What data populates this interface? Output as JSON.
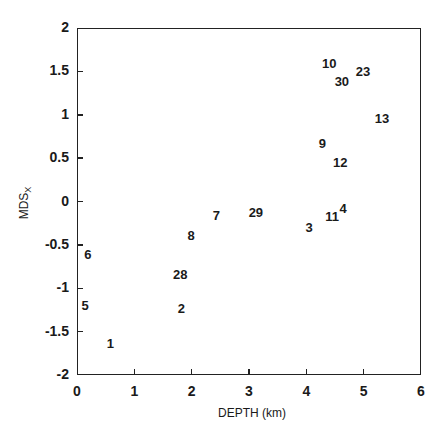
{
  "chart_data": {
    "type": "scatter",
    "title": "",
    "xlabel": "DEPTH (km)",
    "ylabel": "MDS",
    "ylabel_subscript": "X",
    "xlim": [
      0,
      6
    ],
    "ylim": [
      -2,
      2
    ],
    "x_ticks": [
      "0",
      "1",
      "2",
      "3",
      "4",
      "5",
      "6"
    ],
    "y_ticks": [
      "2",
      "1.5",
      "1",
      "0.5",
      "0",
      "-0.5",
      "-1",
      "-1.5",
      "-2"
    ],
    "grid": false,
    "legend": null,
    "marker_style": "numeric text labels",
    "points": [
      {
        "label": "1",
        "x": 0.58,
        "y": -1.63
      },
      {
        "label": "2",
        "x": 1.82,
        "y": -1.23
      },
      {
        "label": "3",
        "x": 4.05,
        "y": -0.29
      },
      {
        "label": "4",
        "x": 4.64,
        "y": -0.07
      },
      {
        "label": "5",
        "x": 0.14,
        "y": -1.19
      },
      {
        "label": "6",
        "x": 0.19,
        "y": -0.6
      },
      {
        "label": "7",
        "x": 2.43,
        "y": -0.16
      },
      {
        "label": "8",
        "x": 1.99,
        "y": -0.39
      },
      {
        "label": "9",
        "x": 4.28,
        "y": 0.67
      },
      {
        "label": "10",
        "x": 4.4,
        "y": 1.6
      },
      {
        "label": "11",
        "x": 4.45,
        "y": -0.17
      },
      {
        "label": "12",
        "x": 4.59,
        "y": 0.46
      },
      {
        "label": "13",
        "x": 5.32,
        "y": 0.96
      },
      {
        "label": "23",
        "x": 4.99,
        "y": 1.51
      },
      {
        "label": "28",
        "x": 1.8,
        "y": -0.83
      },
      {
        "label": "29",
        "x": 3.12,
        "y": -0.12
      },
      {
        "label": "30",
        "x": 4.62,
        "y": 1.39
      }
    ]
  }
}
